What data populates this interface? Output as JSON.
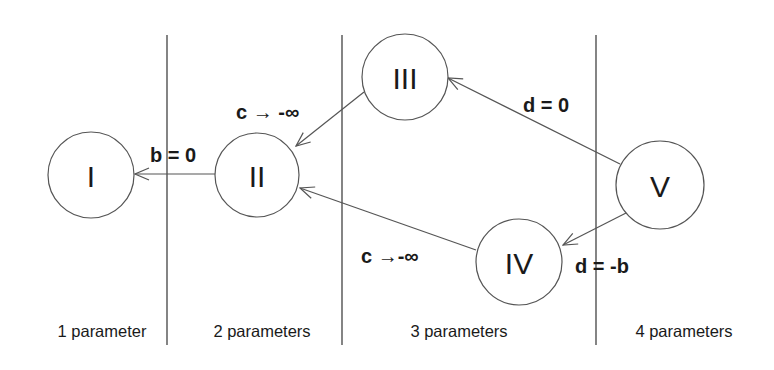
{
  "diagram": {
    "type": "state-reduction-graph",
    "dividers_x": [
      167,
      342,
      596
    ],
    "regions": [
      {
        "id": "r1",
        "label": "1 parameter",
        "x": 102
      },
      {
        "id": "r2",
        "label": "2 parameters",
        "x": 262
      },
      {
        "id": "r3",
        "label": "3 parameters",
        "x": 459
      },
      {
        "id": "r4",
        "label": "4 parameters",
        "x": 684
      }
    ],
    "nodes": [
      {
        "id": "I",
        "label": "I",
        "cx": 91,
        "cy": 175,
        "r": 43
      },
      {
        "id": "II",
        "label": "II",
        "cx": 257,
        "cy": 175,
        "r": 42
      },
      {
        "id": "III",
        "label": "III",
        "cx": 405,
        "cy": 77,
        "r": 43
      },
      {
        "id": "IV",
        "label": "IV",
        "cx": 519,
        "cy": 262,
        "r": 43
      },
      {
        "id": "V",
        "label": "V",
        "cx": 660,
        "cy": 185,
        "r": 44
      }
    ],
    "edges": [
      {
        "from": "II",
        "to": "I",
        "label": "b = 0"
      },
      {
        "from": "III",
        "to": "II",
        "label": "c → -∞"
      },
      {
        "from": "IV",
        "to": "II",
        "label": "c →-∞"
      },
      {
        "from": "V",
        "to": "III",
        "label": "d = 0"
      },
      {
        "from": "V",
        "to": "IV",
        "label": "d = -b"
      }
    ]
  },
  "labels": {
    "edge_II_I": "b = 0",
    "edge_III_II": "c → -∞",
    "edge_IV_II": "c →-∞",
    "edge_V_III": "d = 0",
    "edge_V_IV": "d = -b",
    "node_I": "I",
    "node_II": "II",
    "node_III": "III",
    "node_IV": "IV",
    "node_V": "V",
    "region_1": "1 parameter",
    "region_2": "2 parameters",
    "region_3": "3 parameters",
    "region_4": "4 parameters"
  },
  "colors": {
    "line": "#555555",
    "divider": "#333333",
    "text": "#1a1a1a",
    "background": "#ffffff"
  }
}
